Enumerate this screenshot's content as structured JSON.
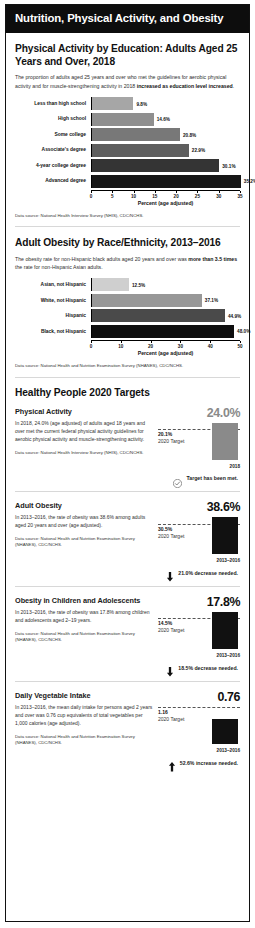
{
  "header": {
    "title": "Nutrition, Physical Activity, and Obesity"
  },
  "sections": {
    "education": {
      "title": "Physical Activity by Education: Adults Aged 25 Years and Over, 2018",
      "desc_plain": "The proportion of adults aged 25 years and over who met the guidelines for aerobic physical activity and for muscle-strengthening activity in 2018 ",
      "desc_bold": "increased as education level increased",
      "desc_tail": ".",
      "source": "Data source: National Health Interview Survey (NHIS), CDC/NCHS."
    },
    "race": {
      "title": "Adult Obesity by Race/Ethnicity, 2013–2016",
      "desc_plain": "The obesity rate for non-Hispanic black adults aged 20 years and over was ",
      "desc_bold": "more than 3.5 times",
      "desc_tail": " the rate for non-Hispanic Asian adults.",
      "source": "Data source: National Health and Nutrition Examination Survey (NHANES), CDC/NCHS."
    },
    "hp2020": {
      "title": "Healthy People 2020 Targets"
    }
  },
  "chart_data": [
    {
      "type": "bar",
      "orientation": "horizontal",
      "title": "Physical Activity by Education: Adults Aged 25 Years and Over, 2018",
      "categories": [
        "Less than high school",
        "High school",
        "Some college",
        "Associate's degree",
        "4-year college degree",
        "Advanced degree"
      ],
      "values": [
        9.8,
        14.6,
        20.8,
        22.9,
        30.1,
        35.2
      ],
      "value_labels": [
        "9.8%",
        "14.6%",
        "20.8%",
        "22.9%",
        "30.1%",
        "35.2%"
      ],
      "bar_colors": [
        "#a6a6a6",
        "#8f8f8f",
        "#787878",
        "#5e5e5e",
        "#343434",
        "#161616"
      ],
      "xlabel": "Percent (age adjusted)",
      "ylabel": "",
      "xlim": [
        0,
        35
      ],
      "xticks": [
        0,
        5,
        10,
        15,
        20,
        25,
        30,
        35
      ],
      "xticklabels": [
        "0",
        "5",
        "10",
        "15",
        "20",
        "25",
        "30",
        "35"
      ],
      "grid": false,
      "legend": "none"
    },
    {
      "type": "bar",
      "orientation": "horizontal",
      "title": "Adult Obesity by Race/Ethnicity, 2013–2016",
      "categories": [
        "Asian, not Hispanic",
        "White, not Hispanic",
        "Hispanic",
        "Black, not Hispanic"
      ],
      "values": [
        12.5,
        37.1,
        44.9,
        48.0
      ],
      "value_labels": [
        "12.5%",
        "37.1%",
        "44.9%",
        "48.0%"
      ],
      "bar_colors": [
        "#cfcfcf",
        "#989898",
        "#4a4a4a",
        "#0e0e0e"
      ],
      "xlabel": "Percent (age adjusted)",
      "ylabel": "",
      "xlim": [
        0,
        50
      ],
      "xticks": [
        0,
        10,
        20,
        30,
        40,
        50
      ],
      "xticklabels": [
        "0",
        "10",
        "20",
        "30",
        "40",
        "50"
      ],
      "grid": false,
      "legend": "none"
    }
  ],
  "targets": [
    {
      "name": "Physical Activity",
      "desc": "In 2018, 24.0% (age adjusted) of adults aged 18 years and over met the current federal physical activity guidelines for aerobic physical activity and muscle-strengthening activity.",
      "source": "Data source: National Health Interview Survey (NHIS), CDC/NCHS.",
      "value_label": "24.0%",
      "value": 24.0,
      "target_label": "20.1%",
      "target": 20.1,
      "target_caption": "2020 Target",
      "period": "2018",
      "bar_color": "#8a8a8a",
      "value_color": "#8a8a8a",
      "status_text": "Target has been met.",
      "status_icon": "check-circle-icon",
      "status_direction": "met"
    },
    {
      "name": "Adult Obesity",
      "desc": "In 2013–2016, the rate of obesity was 38.6% among adults aged 20 years and over (age adjusted).",
      "source": "Data source: National Health and Nutrition Examination Survey (NHANES), CDC/NCHS.",
      "value_label": "38.6%",
      "value": 38.6,
      "target_label": "30.5%",
      "target": 30.5,
      "target_caption": "2020 Target",
      "period": "2013–2016",
      "bar_color": "#111111",
      "value_color": "#111111",
      "status_text": "21.0% decrease needed.",
      "status_icon": "arrow-down-icon",
      "status_direction": "down"
    },
    {
      "name": "Obesity in Children and Adolescents",
      "desc": "In 2013–2016, the rate of obesity was 17.8% among children and adolescents aged 2–19 years.",
      "source": "Data source: National Health and Nutrition Examination Survey (NHANES), CDC/NCHS.",
      "value_label": "17.8%",
      "value": 17.8,
      "target_label": "14.5%",
      "target": 14.5,
      "target_caption": "2020 Target",
      "period": "2013–2016",
      "bar_color": "#111111",
      "value_color": "#111111",
      "status_text": "18.5% decrease needed.",
      "status_icon": "arrow-down-icon",
      "status_direction": "down"
    },
    {
      "name": "Daily Vegetable Intake",
      "desc": "In 2013–2016, the mean daily intake for persons aged 2 years and over was 0.76 cup equivalents of total vegetables per 1,000 calories (age adjusted).",
      "source": "Data source: National Health and Nutrition Examination Survey (NHANES), CDC/NCHS.",
      "value_label": "0.76",
      "value": 0.76,
      "target_label": "1.16",
      "target": 1.16,
      "target_caption": "2020 Target",
      "period": "2013–2016",
      "bar_color": "#111111",
      "value_color": "#111111",
      "status_text": "52.6% increase needed.",
      "status_icon": "arrow-up-icon",
      "status_direction": "up"
    }
  ]
}
